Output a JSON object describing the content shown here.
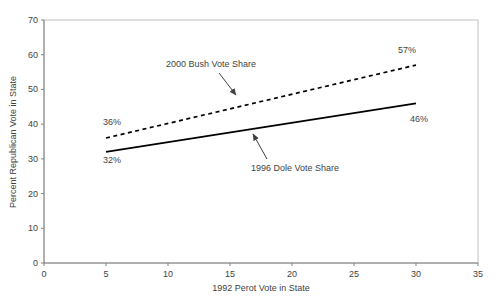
{
  "colors": {
    "background": "#ffffff",
    "text": "#3f3f3f",
    "axis": "#808080",
    "plot_border": "#c0c0c0",
    "line": "#000000",
    "annotation": "#404040"
  },
  "chart_data": {
    "type": "line",
    "title": "",
    "xlabel": "1992 Perot Vote in State",
    "ylabel": "Percent Republican Vote in State",
    "xlim": [
      0,
      35
    ],
    "ylim": [
      0,
      70
    ],
    "x_ticks": [
      0,
      5,
      10,
      15,
      20,
      25,
      30,
      35
    ],
    "y_ticks": [
      0,
      10,
      20,
      30,
      40,
      50,
      60,
      70
    ],
    "grid": false,
    "legend_position": "none",
    "series": [
      {
        "name": "2000 Bush Vote Share",
        "style": "dashed",
        "color": "#000000",
        "x": [
          5,
          30
        ],
        "y": [
          36,
          57
        ],
        "point_labels": [
          "36%",
          "57%"
        ]
      },
      {
        "name": "1996 Dole Vote Share",
        "style": "solid",
        "color": "#000000",
        "x": [
          5,
          30
        ],
        "y": [
          32,
          46
        ],
        "point_labels": [
          "32%",
          "46%"
        ]
      }
    ],
    "annotations": [
      {
        "text": "2000 Bush Vote Share",
        "points_to_series": "2000 Bush Vote Share",
        "arrow": true
      },
      {
        "text": "1996 Dole Vote Share",
        "points_to_series": "1996 Dole Vote Share",
        "arrow": true
      }
    ]
  }
}
